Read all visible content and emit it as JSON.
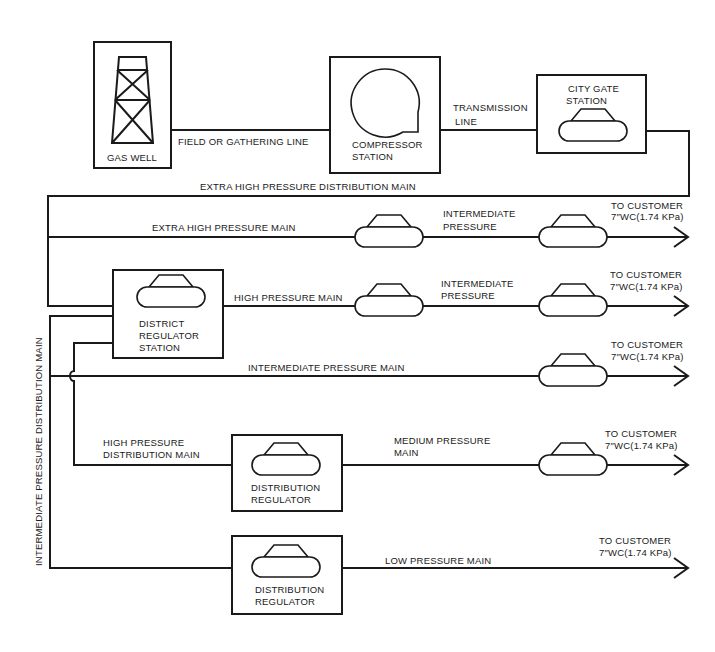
{
  "diagram": {
    "type": "natural gas transmission and distribution system schematic",
    "colors": {
      "line": "#1a1a1a",
      "background": "#ffffff"
    },
    "nodes": {
      "gas_well": {
        "label": "GAS WELL",
        "icon": "derrick-icon"
      },
      "compressor": {
        "label_line1": "COMPRESSOR",
        "label_line2": "STATION",
        "icon": "compressor-icon"
      },
      "city_gate": {
        "label_line1": "CITY GATE",
        "label_line2": "STATION",
        "icon": "regulator-icon"
      },
      "district_regulator": {
        "label_line1": "DISTRICT",
        "label_line2": "REGULATOR",
        "label_line3": "STATION",
        "icon": "regulator-icon"
      },
      "distribution_regulator_1": {
        "label_line1": "DISTRIBUTION",
        "label_line2": "REGULATOR",
        "icon": "regulator-icon"
      },
      "distribution_regulator_2": {
        "label_line1": "DISTRIBUTION",
        "label_line2": "REGULATOR",
        "icon": "regulator-icon"
      }
    },
    "lines": {
      "field_gathering": "FIELD OR GATHERING LINE",
      "transmission_line1": "TRANSMISSION",
      "transmission_line2": "LINE",
      "extra_high_dist_main": "EXTRA HIGH PRESSURE DISTRIBUTION MAIN",
      "extra_high_main": "EXTRA HIGH PRESSURE MAIN",
      "intermediate_1_line1": "INTERMEDIATE",
      "intermediate_1_line2": "PRESSURE",
      "high_main": "HIGH PRESSURE MAIN",
      "intermediate_2_line1": "INTERMEDIATE",
      "intermediate_2_line2": "PRESSURE",
      "intermediate_main": "INTERMEDIATE PRESSURE MAIN",
      "high_dist_main_line1": "HIGH PRESSURE",
      "high_dist_main_line2": "DISTRIBUTION MAIN",
      "medium_main_line1": "MEDIUM PRESSURE",
      "medium_main_line2": "MAIN",
      "low_main": "LOW PRESSURE MAIN",
      "vertical_intermediate_dist_main": "INTERMEDIATE PRESSURE  DISTRIBUTION MAIN"
    },
    "outputs": [
      {
        "line1": "TO CUSTOMER",
        "line2": "7″WC(1.74 KPa)"
      },
      {
        "line1": "TO CUSTOMER",
        "line2": "7″WC(1.74 KPa)"
      },
      {
        "line1": "TO CUSTOMER",
        "line2": "7″WC(1.74 KPa)"
      },
      {
        "line1": "TO CUSTOMER",
        "line2": "7″WC(1.74 KPa)"
      },
      {
        "line1": "TO CUSTOMER",
        "line2": "7″WC(1.74 KPa)"
      }
    ]
  }
}
